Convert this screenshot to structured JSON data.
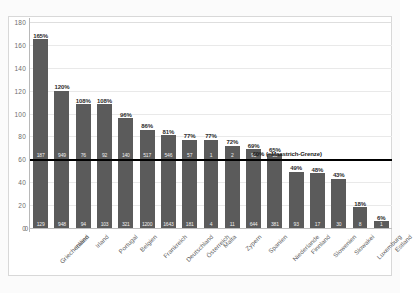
{
  "chart_data": {
    "type": "bar",
    "title": "",
    "xlabel": "",
    "ylabel": "",
    "ylim": [
      0,
      180
    ],
    "yticks": [
      0,
      20,
      40,
      60,
      80,
      100,
      120,
      140,
      160,
      180
    ],
    "grid": true,
    "legend": "none",
    "bar_color": "#5b5b5b",
    "reference_line": {
      "value": 60,
      "label": "60% (=Maastrich-Grenze)",
      "color": "#000000"
    },
    "categories": [
      "Griechenland",
      "Italien",
      "Irland",
      "Portugal",
      "Belgien",
      "Frankreich",
      "Deutschland",
      "Österreich",
      "Malta",
      "Zypern",
      "Spanien",
      "Niederlande",
      "Finnland",
      "Slowenien",
      "Slowakei",
      "Luxemburg",
      "Estland"
    ],
    "values": [
      165,
      120,
      108,
      108,
      96,
      86,
      81,
      77,
      77,
      72,
      69,
      65,
      49,
      48,
      43,
      18,
      6
    ],
    "pct_labels": [
      "165%",
      "120%",
      "108%",
      "108%",
      "96%",
      "86%",
      "81%",
      "77%",
      "77%",
      "72%",
      "69%",
      "65%",
      "49%",
      "48%",
      "43%",
      "18%",
      "6%"
    ],
    "values_upper": [
      "187",
      "949",
      "76",
      "92",
      "140",
      "517",
      "546",
      "57",
      "1",
      "2",
      "91",
      "10",
      "",
      "",
      "",
      "",
      ""
    ],
    "values_lower": [
      "129",
      "948",
      "94",
      "103",
      "321",
      "1200",
      "1643",
      "181",
      "4",
      "11",
      "644",
      "381",
      "93",
      "17",
      "30",
      "8",
      "1"
    ]
  }
}
